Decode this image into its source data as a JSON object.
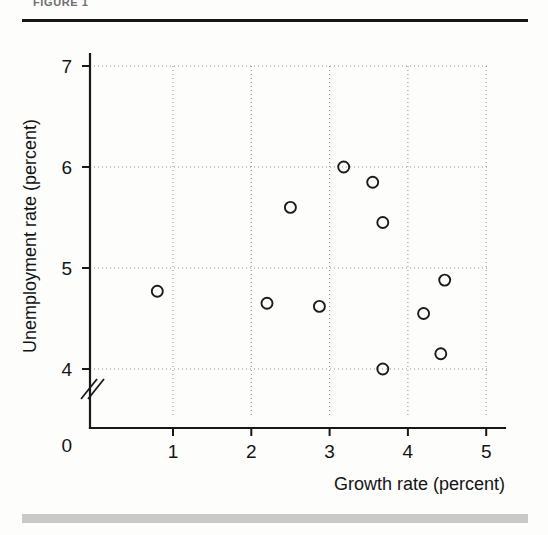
{
  "page": {
    "header_fragment": "FIGURE 1",
    "header_rule": "header-divider",
    "footer_rule": "footer-divider"
  },
  "chart_data": {
    "type": "scatter",
    "title": "",
    "xlabel": "Growth rate (percent)",
    "ylabel": "Unemployment rate (percent)",
    "xlim": [
      0,
      5.4
    ],
    "ylim": [
      3.6,
      7.1
    ],
    "xticks": [
      "1",
      "2",
      "3",
      "4",
      "5"
    ],
    "xtick_values": [
      1,
      2,
      3,
      4,
      5
    ],
    "yticks": [
      "7",
      "6",
      "5",
      "4"
    ],
    "ytick_values": [
      7,
      6,
      5,
      4
    ],
    "origin_label": "0",
    "y_axis_break": true,
    "grid": true,
    "grid_style": "dotted",
    "legend": "none",
    "marker": "open-circle",
    "marker_size": 11,
    "points": [
      {
        "x": 0.8,
        "y": 4.77
      },
      {
        "x": 2.2,
        "y": 4.65
      },
      {
        "x": 2.5,
        "y": 5.6
      },
      {
        "x": 2.87,
        "y": 4.62
      },
      {
        "x": 3.18,
        "y": 6.0
      },
      {
        "x": 3.55,
        "y": 5.85
      },
      {
        "x": 3.68,
        "y": 5.45
      },
      {
        "x": 3.68,
        "y": 4.0
      },
      {
        "x": 4.2,
        "y": 4.55
      },
      {
        "x": 4.42,
        "y": 4.15
      },
      {
        "x": 4.47,
        "y": 4.88
      }
    ]
  }
}
